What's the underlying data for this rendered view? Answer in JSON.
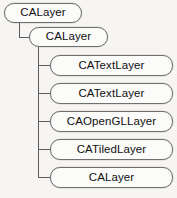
{
  "diagram": {
    "type": "tree",
    "background_color": "#f6f5f3",
    "node_border_color": "#6f6f6f",
    "node_fill_color": "#fbfbfa",
    "connector_color": "#5d5d5d",
    "text_color": "#101010"
  },
  "nodes": {
    "root": {
      "label": "CALayer"
    },
    "level2": {
      "label": "CALayer"
    },
    "children": [
      {
        "label": "CATextLayer"
      },
      {
        "label": "CATextLayer"
      },
      {
        "label": "CAOpenGLLayer"
      },
      {
        "label": "CATiledLayer"
      },
      {
        "label": "CALayer"
      }
    ]
  }
}
